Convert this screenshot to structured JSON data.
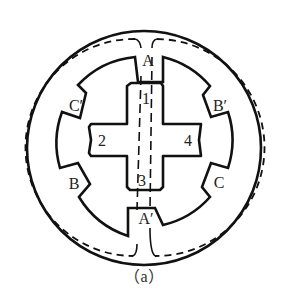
{
  "diagram": {
    "caption": "（a）",
    "stator_poles": {
      "A": "A",
      "A_prime": "A′",
      "B": "B",
      "B_prime": "B′",
      "C": "C",
      "C_prime": "C′"
    },
    "rotor_teeth": {
      "t1": "1",
      "t2": "2",
      "t3": "3",
      "t4": "4"
    },
    "colors": {
      "stroke": "#111111",
      "background": "#ffffff"
    }
  }
}
